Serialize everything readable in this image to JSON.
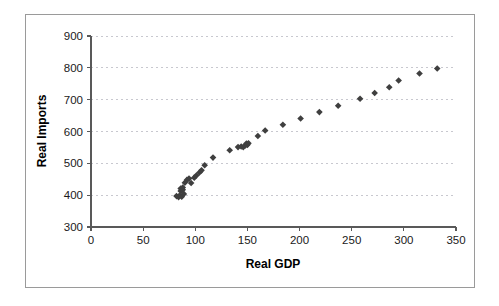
{
  "chart_data": {
    "type": "scatter",
    "title": "",
    "xlabel": "Real GDP",
    "ylabel": "Real Imports",
    "xlim": [
      0,
      350
    ],
    "ylim": [
      300,
      900
    ],
    "xticks": [
      0,
      50,
      100,
      150,
      200,
      250,
      300,
      350
    ],
    "yticks": [
      300,
      400,
      500,
      600,
      700,
      800,
      900
    ],
    "grid": "horizontal-dashed",
    "legend": "none",
    "marker": "diamond",
    "marker_color": "#3f3f3f",
    "series": [
      {
        "name": "Real Imports vs Real GDP",
        "points": [
          [
            82,
            397
          ],
          [
            84,
            394
          ],
          [
            85,
            399
          ],
          [
            86,
            421
          ],
          [
            86,
            413
          ],
          [
            87,
            395
          ],
          [
            88,
            424
          ],
          [
            88,
            417
          ],
          [
            89,
            404
          ],
          [
            90,
            439
          ],
          [
            92,
            448
          ],
          [
            94,
            452
          ],
          [
            96,
            438
          ],
          [
            99,
            455
          ],
          [
            101,
            462
          ],
          [
            104,
            471
          ],
          [
            106,
            478
          ],
          [
            109,
            494
          ],
          [
            117,
            518
          ],
          [
            133,
            541
          ],
          [
            141,
            551
          ],
          [
            144,
            553
          ],
          [
            146,
            551
          ],
          [
            148,
            556
          ],
          [
            149,
            562
          ],
          [
            150,
            558
          ],
          [
            151,
            563
          ],
          [
            160,
            586
          ],
          [
            167,
            603
          ],
          [
            184,
            621
          ],
          [
            201,
            641
          ],
          [
            219,
            661
          ],
          [
            237,
            681
          ],
          [
            258,
            703
          ],
          [
            272,
            721
          ],
          [
            286,
            739
          ],
          [
            295,
            760
          ],
          [
            315,
            782
          ],
          [
            332,
            798
          ]
        ]
      }
    ]
  },
  "axes": {
    "x_title": "Real GDP",
    "y_title": "Real Imports",
    "x_tick_labels": [
      "0",
      "50",
      "100",
      "150",
      "200",
      "250",
      "300",
      "350"
    ],
    "y_tick_labels": [
      "300",
      "400",
      "500",
      "600",
      "700",
      "800",
      "900"
    ]
  }
}
